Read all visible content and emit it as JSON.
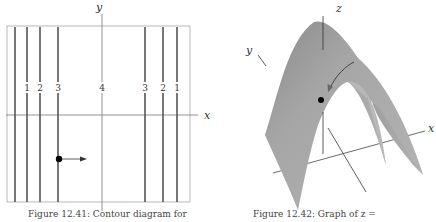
{
  "left_figure": {
    "axes": {
      "x_label": "x",
      "y_label": "y"
    },
    "contour_labels": [
      "1",
      "2",
      "3",
      "4",
      "3",
      "2",
      "1"
    ],
    "caption": "Figure 12.41: Contour diagram for"
  },
  "right_figure": {
    "axes": {
      "x_label": "x",
      "y_label": "y",
      "z_label": "z"
    },
    "caption": "Figure 12.42: Graph of z ="
  },
  "colors": {
    "contour_line": "#555555",
    "axis_line": "#777777",
    "surface": "#a8a8a8",
    "surface_dark": "#8c8c8c",
    "point": "#000000"
  }
}
